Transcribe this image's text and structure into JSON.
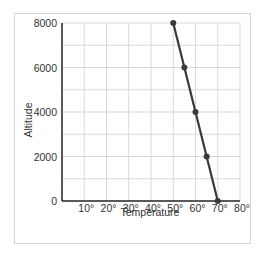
{
  "chart_data": {
    "type": "line",
    "title": "",
    "xlabel": "Temperature",
    "ylabel": "Altitude",
    "x_ticks": [
      "10°",
      "20°",
      "30°",
      "40°",
      "50°",
      "60°",
      "70°",
      "80°"
    ],
    "y_ticks": [
      "0",
      "2000",
      "4000",
      "6000",
      "8000"
    ],
    "xlim": [
      0,
      80
    ],
    "ylim": [
      0,
      8000
    ],
    "grid": true,
    "series": [
      {
        "name": "Altitude vs Temperature",
        "x": [
          50,
          55,
          60,
          65,
          70
        ],
        "y": [
          8000,
          6000,
          4000,
          2000,
          0
        ]
      }
    ],
    "colors": {
      "line": "#3a3a3a",
      "grid": "#d9d9d9",
      "axis": "#222222",
      "frame": "#d6d6d6"
    }
  }
}
